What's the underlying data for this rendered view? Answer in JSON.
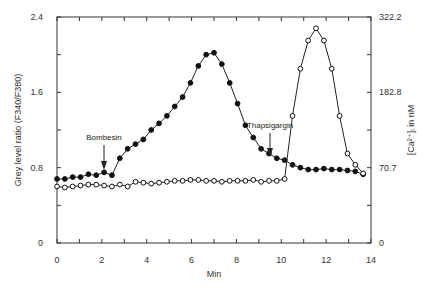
{
  "chart_data": {
    "type": "line",
    "title": "",
    "xlabel": "Min",
    "ylabel": "Grey level ratio (F340/F380)",
    "y2label": "[Ca2+]i in nM",
    "xlim": [
      0,
      14
    ],
    "ylim": [
      0,
      2.4
    ],
    "x_ticks": [
      "0",
      "2",
      "4",
      "6",
      "8",
      "10",
      "12",
      "14"
    ],
    "y_ticks": [
      "0",
      "0.8",
      "1.6",
      "2.4"
    ],
    "y2_ticks": [
      "0",
      "70.7",
      "182.8",
      "322.2"
    ],
    "grid": false,
    "legend": "none",
    "annotations": [
      {
        "text": "Bombesin",
        "x": 2.1,
        "arrow_to_y": 0.75
      },
      {
        "text": "Thapsigargin",
        "x": 9.5,
        "arrow_to_y": 0.89
      }
    ],
    "series": [
      {
        "name": "filled-circles",
        "marker": "filled",
        "x": [
          0,
          0.35,
          0.7,
          1.05,
          1.4,
          1.75,
          2.1,
          2.45,
          2.8,
          3.15,
          3.5,
          3.85,
          4.2,
          4.55,
          4.9,
          5.25,
          5.6,
          5.95,
          6.3,
          6.65,
          7.0,
          7.35,
          7.7,
          8.05,
          8.4,
          8.75,
          9.1,
          9.45,
          9.8,
          10.15,
          10.5,
          10.85,
          11.2,
          11.55,
          11.9,
          12.25,
          12.6,
          12.95,
          13.3,
          13.65
        ],
        "values": [
          0.68,
          0.68,
          0.7,
          0.7,
          0.73,
          0.72,
          0.75,
          0.72,
          0.9,
          1.0,
          1.05,
          1.1,
          1.2,
          1.27,
          1.35,
          1.45,
          1.55,
          1.7,
          1.88,
          2.0,
          2.02,
          1.9,
          1.7,
          1.48,
          1.25,
          1.12,
          1.0,
          0.95,
          0.9,
          0.88,
          0.83,
          0.8,
          0.78,
          0.78,
          0.79,
          0.78,
          0.78,
          0.77,
          0.76,
          0.73
        ]
      },
      {
        "name": "open-circles",
        "marker": "open",
        "x": [
          0,
          0.35,
          0.7,
          1.05,
          1.4,
          1.75,
          2.1,
          2.45,
          2.8,
          3.15,
          3.5,
          3.85,
          4.2,
          4.55,
          4.9,
          5.25,
          5.6,
          5.95,
          6.3,
          6.65,
          7.0,
          7.35,
          7.7,
          8.05,
          8.4,
          8.75,
          9.1,
          9.45,
          9.8,
          10.15,
          10.5,
          10.85,
          11.2,
          11.55,
          11.9,
          12.25,
          12.6,
          12.95,
          13.3,
          13.65
        ],
        "values": [
          0.6,
          0.59,
          0.6,
          0.61,
          0.62,
          0.62,
          0.61,
          0.6,
          0.62,
          0.6,
          0.65,
          0.64,
          0.63,
          0.64,
          0.65,
          0.66,
          0.66,
          0.67,
          0.67,
          0.66,
          0.66,
          0.65,
          0.66,
          0.66,
          0.66,
          0.67,
          0.65,
          0.66,
          0.66,
          0.68,
          1.35,
          1.85,
          2.15,
          2.28,
          2.15,
          1.85,
          1.35,
          0.95,
          0.83,
          0.74
        ]
      }
    ]
  },
  "axes": {
    "x_label": "Min",
    "y_label": "Grey level ratio (F340/F380)",
    "y2_label": "[Ca²⁺]ᵢ in nM"
  },
  "annotations": {
    "bombesin": "Bombesin",
    "thapsigargin": "Thapsigargin"
  }
}
